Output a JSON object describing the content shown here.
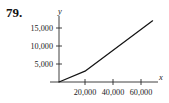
{
  "figure": {
    "problem_number": "79.",
    "x_axis_name": "x",
    "y_axis_name": "y"
  },
  "chart_data": {
    "type": "line",
    "title": "",
    "subtitle": "",
    "xlabel": "x",
    "ylabel": "y",
    "grid": false,
    "legend": false,
    "legend_position": "none",
    "xlim": [
      0,
      75000
    ],
    "ylim": [
      0,
      18500
    ],
    "x_ticks": [
      20000,
      40000,
      60000
    ],
    "x_tick_labels": [
      "20,000",
      "40,000",
      "60,000"
    ],
    "y_ticks": [
      5000,
      10000,
      15000
    ],
    "y_tick_labels": [
      "5,000",
      "10,000",
      "15,000"
    ],
    "series": [
      {
        "name": "piecewise-linear-graph",
        "x": [
          0,
          20000,
          72000
        ],
        "values": [
          0,
          3000,
          17000
        ],
        "color": "#141414"
      }
    ],
    "annotations": [
      "79."
    ]
  }
}
